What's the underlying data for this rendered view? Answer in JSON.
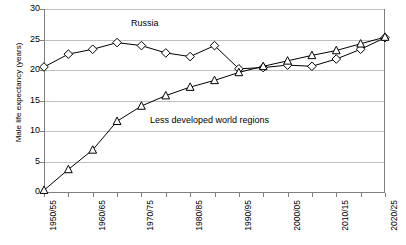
{
  "chart_data": {
    "type": "line",
    "title": "",
    "xlabel": "",
    "ylabel": "Male life expectancy (years)",
    "categories": [
      "1950/55",
      "1955/60",
      "1960/65",
      "1965/70",
      "1970/75",
      "1975/80",
      "1980/85",
      "1985/90",
      "1990/95",
      "1995/00",
      "2000/05",
      "2005/10",
      "2010/15",
      "2015/20",
      "2020/25"
    ],
    "xtick_labels_shown": [
      "1950/55",
      "1960/65",
      "1970/75",
      "1980/85",
      "1990/95",
      "2000/05",
      "2010/15",
      "2020/25"
    ],
    "ytick_labels": [
      "0",
      "5",
      "10",
      "15",
      "20",
      "25",
      "30"
    ],
    "ylim": [
      0,
      30
    ],
    "grid": true,
    "legend_position": "inline-annotation",
    "series": [
      {
        "name": "Russia",
        "marker": "diamond",
        "label_text": "Russia",
        "values": [
          20.5,
          22.6,
          23.4,
          24.5,
          24.0,
          22.8,
          22.2,
          24.0,
          20.2,
          20.4,
          20.8,
          20.6,
          21.8,
          23.4,
          25.3
        ]
      },
      {
        "name": "Less developed world regions",
        "marker": "triangle",
        "label_text": "Less developed world regions",
        "values": [
          0.3,
          3.7,
          6.9,
          11.6,
          14.1,
          15.8,
          17.2,
          18.3,
          19.6,
          20.6,
          21.5,
          22.4,
          23.2,
          24.3,
          25.4
        ]
      }
    ]
  },
  "annotations": {
    "russia_label": "Russia",
    "less_developed_label": "Less developed world regions"
  },
  "colors": {
    "line": "#000000",
    "grid": "#bfbfbf",
    "axis": "#7f7f7f",
    "background": "#ffffff"
  }
}
